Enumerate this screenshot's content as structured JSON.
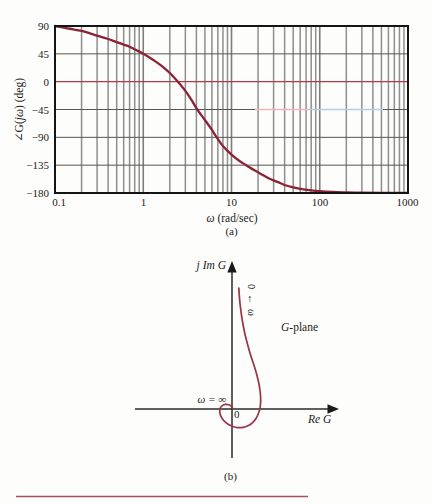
{
  "figure": {
    "caption_a": "(a)",
    "caption_b": "(b)",
    "background": "#fdfdfb",
    "bottom_rule_color": "#a84f60"
  },
  "chart_data": [
    {
      "id": "bode-phase-plot",
      "type": "line",
      "x_scale": "log",
      "xlabel": "ω (rad/sec)",
      "xlabel_italic": "ω",
      "xlabel_rest": " (rad/sec)",
      "ylabel": "∠G(jω) (deg)",
      "ylabel_pre": "∠G(",
      "ylabel_italic": "jω",
      "ylabel_post": ") (deg)",
      "caption": "(a)",
      "xlim": [
        0.1,
        1000
      ],
      "ylim": [
        -180,
        90
      ],
      "xticks": [
        "0.1",
        "1",
        "10",
        "100",
        "1000"
      ],
      "xtick_values": [
        0.1,
        1,
        10,
        100,
        1000
      ],
      "yticks": [
        "90",
        "45",
        "0",
        "−45",
        "−90",
        "−135",
        "−180"
      ],
      "ytick_values": [
        90,
        45,
        0,
        -45,
        -90,
        -135,
        -180
      ],
      "grid": "on, log major and minor verticals, 45-deg horizontals",
      "legend": "none",
      "accent_lines": [
        {
          "y": 0,
          "color": "#b23a48",
          "extent": "full"
        },
        {
          "y": -45,
          "color": "#efb6bf",
          "extent": "partial pink"
        },
        {
          "y": -45,
          "color": "#b5cfe2",
          "extent": "partial light blue"
        }
      ],
      "series": [
        {
          "name": "phase of G(jω)",
          "color": "#8b2336",
          "points": [
            [
              0.1,
              90
            ],
            [
              0.13,
              86.9
            ],
            [
              0.16,
              84.6
            ],
            [
              0.2,
              82
            ],
            [
              0.25,
              78
            ],
            [
              0.3,
              74.5
            ],
            [
              0.4,
              69
            ],
            [
              0.5,
              64
            ],
            [
              0.6,
              60
            ],
            [
              0.7,
              56.5
            ],
            [
              0.85,
              50.5
            ],
            [
              1,
              45
            ],
            [
              1.3,
              35
            ],
            [
              1.6,
              26
            ],
            [
              2,
              14
            ],
            [
              2.5,
              -1
            ],
            [
              3,
              -15
            ],
            [
              3.5,
              -29
            ],
            [
              4.1,
              -45
            ],
            [
              5,
              -62
            ],
            [
              6,
              -78
            ],
            [
              6.8,
              -90
            ],
            [
              8,
              -104
            ],
            [
              10,
              -118
            ],
            [
              12,
              -127
            ],
            [
              15,
              -136
            ],
            [
              18,
              -143
            ],
            [
              22,
              -150
            ],
            [
              27,
              -157
            ],
            [
              33,
              -162
            ],
            [
              40,
              -167
            ],
            [
              50,
              -171
            ],
            [
              65,
              -174
            ],
            [
              80,
              -175.8
            ],
            [
              100,
              -177
            ],
            [
              140,
              -178.2
            ],
            [
              200,
              -179
            ],
            [
              300,
              -179.4
            ],
            [
              500,
              -179.6
            ],
            [
              1000,
              -179.8
            ]
          ]
        }
      ]
    },
    {
      "id": "polar-plot",
      "type": "parametric",
      "im_axis_label": "j Im G",
      "re_axis_label": "Re G",
      "plane_label": "G-plane",
      "plane_label_italic": "G",
      "plane_label_rest": "-plane",
      "omega_zero_annotation": "0 ← ω",
      "omega_infinity_annotation": "ω = ∞",
      "origin_label": "0",
      "caption": "(b)",
      "curve_color": "#9a3349",
      "curve_points_re_im": [
        [
          6.8,
          121
        ],
        [
          7.4,
          112
        ],
        [
          8.3,
          103
        ],
        [
          9.6,
          93
        ],
        [
          11.3,
          83
        ],
        [
          13.4,
          73
        ],
        [
          16,
          63
        ],
        [
          18.9,
          53
        ],
        [
          21.9,
          44
        ],
        [
          24.6,
          35
        ],
        [
          26.8,
          26
        ],
        [
          28.2,
          17
        ],
        [
          28.7,
          9
        ],
        [
          28.2,
          2
        ],
        [
          26.6,
          -4
        ],
        [
          24,
          -9.5
        ],
        [
          20.4,
          -13.8
        ],
        [
          16,
          -16.8
        ],
        [
          11,
          -18.4
        ],
        [
          5.8,
          -18.6
        ],
        [
          0.8,
          -17.5
        ],
        [
          -3.9,
          -15.2
        ],
        [
          -7.9,
          -11.9
        ],
        [
          -10.8,
          -7.8
        ],
        [
          -12.2,
          -3.4
        ],
        [
          -11.8,
          0.7
        ],
        [
          -9.8,
          3.4
        ],
        [
          -6.6,
          4.6
        ],
        [
          -3.2,
          4.2
        ],
        [
          -0.6,
          2.6
        ],
        [
          0.6,
          0.9
        ]
      ]
    }
  ]
}
